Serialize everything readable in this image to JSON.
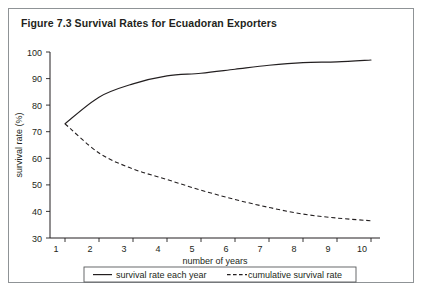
{
  "figure": {
    "title": "Figure 7.3  Survival Rates for Ecuadoran Exporters"
  },
  "chart_data": {
    "type": "line",
    "title": "Figure 7.3  Survival Rates for Ecuadoran Exporters",
    "xlabel": "number of years",
    "ylabel": "survival rate (%)",
    "x": [
      1,
      2,
      3,
      4,
      5,
      6,
      7,
      8,
      9,
      10
    ],
    "xlim": [
      1,
      10
    ],
    "ylim": [
      30,
      100
    ],
    "xticks": [
      "1",
      "2",
      "3",
      "4",
      "5",
      "6",
      "7",
      "8",
      "9",
      "10"
    ],
    "yticks": [
      "30",
      "40",
      "50",
      "60",
      "70",
      "80",
      "90",
      "100"
    ],
    "grid": false,
    "legend_position": "below-axis",
    "series": [
      {
        "name": "survival rate each year",
        "style": "solid",
        "color": "#231f20",
        "values": [
          73,
          83,
          88,
          91,
          92,
          93.5,
          95,
          96,
          96.3,
          97
        ]
      },
      {
        "name": "cumulative survival rate",
        "style": "dashed",
        "color": "#231f20",
        "values": [
          73,
          62,
          56,
          52,
          48,
          44.5,
          41.5,
          39,
          37.5,
          36.5
        ]
      }
    ]
  }
}
